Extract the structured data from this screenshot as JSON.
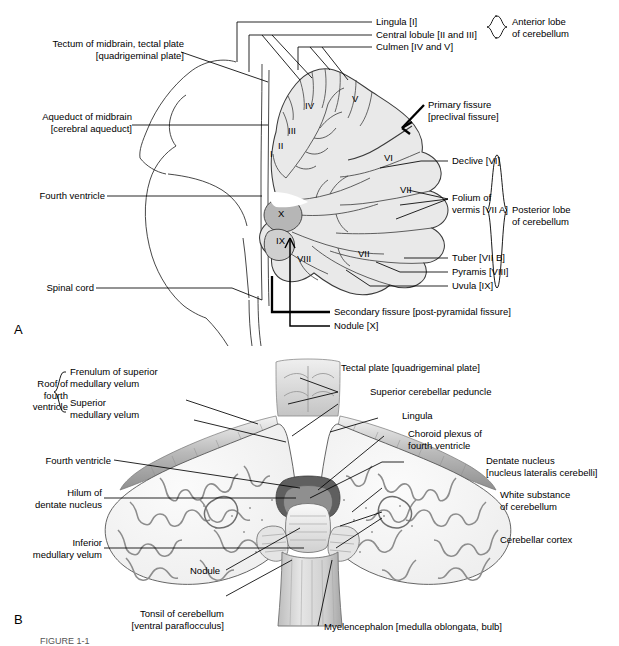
{
  "figure": {
    "panel_a_marker": "A",
    "panel_b_marker": "B",
    "caption_partial": "FIGURE 1-1"
  },
  "panel_a": {
    "title_internal": "Median sagittal section of cerebellum and brainstem",
    "left_labels": [
      {
        "id": "tectum",
        "text": "Tectum of midbrain, tectal plate\n[quadrigeminal plate]"
      },
      {
        "id": "aqueduct",
        "text": "Aqueduct of midbrain\n[cerebral aqueduct]"
      },
      {
        "id": "fourth-ventricle",
        "text": "Fourth ventricle"
      },
      {
        "id": "spinal-cord",
        "text": "Spinal cord"
      }
    ],
    "top_labels": [
      {
        "id": "lingula",
        "text": "Lingula [I]"
      },
      {
        "id": "central-lobule",
        "text": "Central lobule [II and III]"
      },
      {
        "id": "culmen",
        "text": "Culmen [IV and V]"
      }
    ],
    "right_labels": [
      {
        "id": "primary-fissure",
        "text": "Primary fissure\n[preclival fissure]"
      },
      {
        "id": "declive",
        "text": "Declive [VI]"
      },
      {
        "id": "folium",
        "text": "Folium of\nvermis [VII A]"
      },
      {
        "id": "tuber",
        "text": "Tuber [VII B]"
      },
      {
        "id": "pyramis",
        "text": "Pyramis [VIII]"
      },
      {
        "id": "uvula",
        "text": "Uvula [IX]"
      }
    ],
    "bottom_labels": [
      {
        "id": "secondary-fissure",
        "text": "Secondary fissure [post-pyramidal fissure]"
      },
      {
        "id": "nodule",
        "text": "Nodule [X]"
      }
    ],
    "brace_labels": [
      {
        "id": "anterior-lobe",
        "text": "Anterior lobe\nof cerebellum"
      },
      {
        "id": "posterior-lobe",
        "text": "Posterior lobe\nof cerebellum"
      }
    ],
    "roman_numerals": [
      "I",
      "II",
      "III",
      "IV",
      "V",
      "VI",
      "VII",
      "VII",
      "VIII",
      "IX",
      "X"
    ]
  },
  "panel_b": {
    "title_internal": "Dorsal view of cerebellum and brainstem",
    "left_labels": [
      {
        "id": "roof-fourth-ventricle",
        "text": "Roof of\nfourth\nventricle"
      },
      {
        "id": "frenulum",
        "text": "Frenulum of superior\nmedullary velum"
      },
      {
        "id": "superior-medullary-velum",
        "text": "Superior\nmedullary velum"
      },
      {
        "id": "fourth-ventricle-b",
        "text": "Fourth ventricle"
      },
      {
        "id": "hilum-dentate",
        "text": "Hilum of\ndentate nucleus"
      },
      {
        "id": "inferior-medullary-velum",
        "text": "Inferior\nmedullary velum"
      }
    ],
    "right_labels": [
      {
        "id": "tectal-plate",
        "text": "Tectal plate [quadrigeminal plate]"
      },
      {
        "id": "superior-cerebellar-peduncle",
        "text": "Superior cerebellar peduncle"
      },
      {
        "id": "lingula-b",
        "text": "Lingula"
      },
      {
        "id": "choroid-plexus",
        "text": "Choroid plexus of\nfourth ventricle"
      },
      {
        "id": "dentate-nucleus",
        "text": "Dentate nucleus\n[nucleus lateralis cerebelli]"
      },
      {
        "id": "white-substance",
        "text": "White substance\nof cerebellum"
      },
      {
        "id": "cerebellar-cortex",
        "text": "Cerebellar cortex"
      }
    ],
    "bottom_labels": [
      {
        "id": "nodule-b",
        "text": "Nodule"
      },
      {
        "id": "tonsil",
        "text": "Tonsil of cerebellum\n[ventral paraflocculus]"
      },
      {
        "id": "myelencephalon",
        "text": "Myelencephalon [medulla oblongata, bulb]"
      }
    ]
  },
  "colors": {
    "line": "#000000",
    "cerebellum_fill": "#e9e9e9",
    "cerebellum_stroke": "#3a3a3a",
    "nodule_fill": "#b8b8b8",
    "cortex_gray": "#9a9a9a",
    "white_matter": "#f2f2f2",
    "stem_gray": "#c9c9c9",
    "dark_gray": "#6a6a6a"
  }
}
